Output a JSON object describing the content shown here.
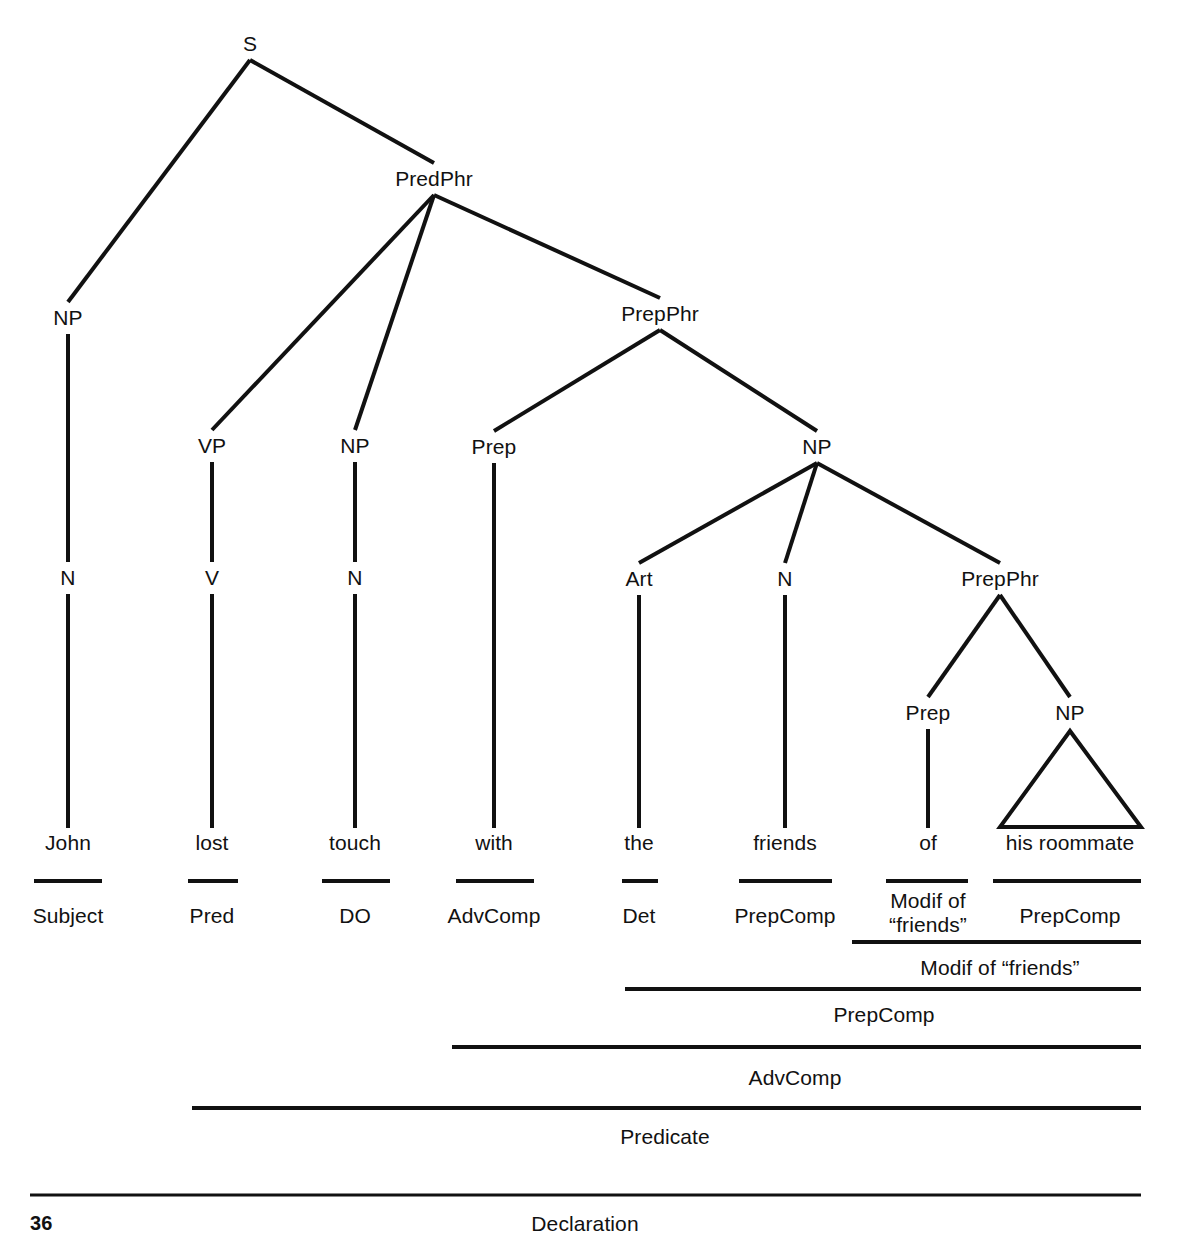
{
  "figure": {
    "type": "syntax-tree-diagram",
    "page_number": "36",
    "sentence": "John lost touch with the friends of his roommate"
  },
  "tree": {
    "nodes": [
      {
        "id": "S",
        "label": "S",
        "x": 250,
        "y": 44
      },
      {
        "id": "NP1",
        "label": "NP",
        "x": 68,
        "y": 318
      },
      {
        "id": "PredPhr",
        "label": "PredPhr",
        "x": 434,
        "y": 179
      },
      {
        "id": "VP",
        "label": "VP",
        "x": 212,
        "y": 446
      },
      {
        "id": "NP2",
        "label": "NP",
        "x": 355,
        "y": 446
      },
      {
        "id": "PrepPhr1",
        "label": "PrepPhr",
        "x": 660,
        "y": 314
      },
      {
        "id": "Prep1",
        "label": "Prep",
        "x": 494,
        "y": 447
      },
      {
        "id": "NP3",
        "label": "NP",
        "x": 817,
        "y": 447
      },
      {
        "id": "N1",
        "label": "N",
        "x": 68,
        "y": 578
      },
      {
        "id": "V",
        "label": "V",
        "x": 212,
        "y": 578
      },
      {
        "id": "N2",
        "label": "N",
        "x": 355,
        "y": 578
      },
      {
        "id": "Art",
        "label": "Art",
        "x": 639,
        "y": 579
      },
      {
        "id": "N3",
        "label": "N",
        "x": 785,
        "y": 579
      },
      {
        "id": "PrepPhr2",
        "label": "PrepPhr",
        "x": 1000,
        "y": 579
      },
      {
        "id": "Prep2",
        "label": "Prep",
        "x": 928,
        "y": 713
      },
      {
        "id": "NP4",
        "label": "NP",
        "x": 1070,
        "y": 713
      }
    ]
  },
  "words": [
    {
      "id": "w-john",
      "label": "John",
      "x": 68,
      "y": 843
    },
    {
      "id": "w-lost",
      "label": "lost",
      "x": 212,
      "y": 843
    },
    {
      "id": "w-touch",
      "label": "touch",
      "x": 355,
      "y": 843
    },
    {
      "id": "w-with",
      "label": "with",
      "x": 494,
      "y": 843
    },
    {
      "id": "w-the",
      "label": "the",
      "x": 639,
      "y": 843
    },
    {
      "id": "w-friends",
      "label": "friends",
      "x": 785,
      "y": 843
    },
    {
      "id": "w-of",
      "label": "of",
      "x": 928,
      "y": 843
    },
    {
      "id": "w-roommate",
      "label": "his roommate",
      "x": 1070,
      "y": 843
    }
  ],
  "functions": [
    {
      "id": "f-subject",
      "label": "Subject",
      "x": 68,
      "y": 916
    },
    {
      "id": "f-pred",
      "label": "Pred",
      "x": 212,
      "y": 916
    },
    {
      "id": "f-do",
      "label": "DO",
      "x": 355,
      "y": 916
    },
    {
      "id": "f-advcomp",
      "label": "AdvComp",
      "x": 494,
      "y": 916
    },
    {
      "id": "f-det",
      "label": "Det",
      "x": 639,
      "y": 916
    },
    {
      "id": "f-prepcomp",
      "label": "PrepComp",
      "x": 785,
      "y": 916
    },
    {
      "id": "f-modif",
      "label": "Modif of\n“friends”",
      "line1": "Modif of",
      "line2": "“friends”",
      "x": 928,
      "y": 913
    },
    {
      "id": "f-prepcomp2",
      "label": "PrepComp",
      "x": 1070,
      "y": 916
    }
  ],
  "brackets": [
    {
      "id": "b-modif-friends",
      "label": "Modif of “friends”",
      "x": 1000,
      "y": 968,
      "line_y": 942,
      "line_x1": 852,
      "line_x2": 1141
    },
    {
      "id": "b-prepcomp",
      "label": "PrepComp",
      "x": 884,
      "y": 1015,
      "line_y": 989,
      "line_x1": 625,
      "line_x2": 1141
    },
    {
      "id": "b-advcomp",
      "label": "AdvComp",
      "x": 795,
      "y": 1078,
      "line_y": 1047,
      "line_x1": 452,
      "line_x2": 1141
    },
    {
      "id": "b-predicate",
      "label": "Predicate",
      "x": 665,
      "y": 1137,
      "line_y": 1108,
      "line_x1": 192,
      "line_x2": 1141
    },
    {
      "id": "b-declaration",
      "label": "Declaration",
      "x": 585,
      "y": 1224,
      "line_y": 1195,
      "line_x1": 30,
      "line_x2": 1141
    }
  ],
  "word_rules": [
    {
      "id": "r-john",
      "x1": 34,
      "x2": 102,
      "y": 881
    },
    {
      "id": "r-lost",
      "x1": 188,
      "x2": 238,
      "y": 881
    },
    {
      "id": "r-touch",
      "x1": 322,
      "x2": 390,
      "y": 881
    },
    {
      "id": "r-with",
      "x1": 456,
      "x2": 534,
      "y": 881
    },
    {
      "id": "r-the",
      "x1": 622,
      "x2": 658,
      "y": 881
    },
    {
      "id": "r-friends",
      "x1": 739,
      "x2": 832,
      "y": 881
    },
    {
      "id": "r-of",
      "x1": 886,
      "x2": 968,
      "y": 881
    },
    {
      "id": "r-roommate",
      "x1": 993,
      "x2": 1141,
      "y": 881
    }
  ],
  "style": {
    "ink_color": "#111111",
    "background_color": "#ffffff"
  }
}
